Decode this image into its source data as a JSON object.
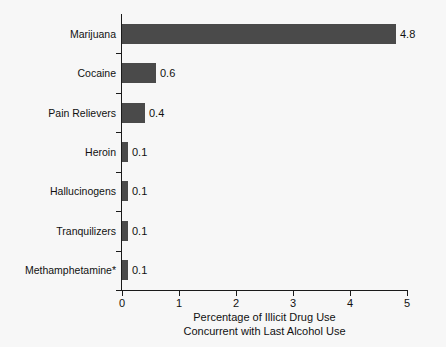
{
  "chart_data": {
    "type": "bar",
    "orientation": "horizontal",
    "title": "",
    "xlabel_line1": "Percentage of Illicit Drug Use",
    "xlabel_line2": "Concurrent with Last Alcohol Use",
    "ylabel": "",
    "categories": [
      "Marijuana",
      "Cocaine",
      "Pain Relievers",
      "Heroin",
      "Hallucinogens",
      "Tranquilizers",
      "Methamphetamine*"
    ],
    "values": [
      4.8,
      0.6,
      0.4,
      0.1,
      0.1,
      0.1,
      0.1
    ],
    "value_labels": [
      "4.8",
      "0.6",
      "0.4",
      "0.1",
      "0.1",
      "0.1",
      "0.1"
    ],
    "xlim": [
      0,
      5
    ],
    "xticks": [
      0,
      1,
      2,
      3,
      4,
      5
    ],
    "xtick_labels": [
      "0",
      "1",
      "2",
      "3",
      "4",
      "5"
    ],
    "grid": false,
    "legend": false,
    "bar_color": "#4a4a4a",
    "axis_color": "#1a1a1a",
    "background_color": "#f7f7f7",
    "text_color": "#111111"
  }
}
